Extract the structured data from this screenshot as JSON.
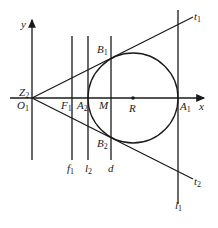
{
  "diagram": {
    "type": "geometry",
    "axes": {
      "x_label": "x",
      "y_label": "y"
    },
    "points": {
      "origin": {
        "main": "O",
        "sub": "1"
      },
      "origin_alt": {
        "main": "Z",
        "sub": "2"
      },
      "F1": {
        "main": "F",
        "sub": "1"
      },
      "A2": {
        "main": "A",
        "sub": "2"
      },
      "M": {
        "main": "M",
        "sub": ""
      },
      "R": {
        "main": "R",
        "sub": ""
      },
      "A1": {
        "main": "A",
        "sub": "1"
      },
      "B1": {
        "main": "B",
        "sub": "1"
      },
      "B2": {
        "main": "B",
        "sub": "2"
      }
    },
    "lines": {
      "f1": {
        "main": "f",
        "sub": "1"
      },
      "l2": {
        "main": "l",
        "sub": "2"
      },
      "d": {
        "main": "d",
        "sub": ""
      },
      "l1": {
        "main": "l",
        "sub": "1"
      },
      "t1": {
        "main": "t",
        "sub": "1"
      },
      "t2": {
        "main": "t",
        "sub": "2"
      }
    },
    "colors": {
      "stroke": "#1a1a1a",
      "background": "#ffffff"
    }
  }
}
